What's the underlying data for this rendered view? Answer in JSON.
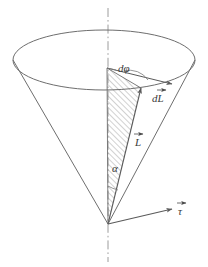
{
  "figure": {
    "background_color": "#ffffff",
    "line_color": "#6e6e6e",
    "label_color": "#3a3a3a",
    "hatch_color": "#9a9a9a",
    "axis_style": "dash-dot"
  },
  "labels": {
    "d_phi": "dφ",
    "dL": "dL",
    "L": "L",
    "alpha": "α",
    "tau": "τ"
  },
  "geometry": {
    "apex": {
      "x": 108,
      "y": 224
    },
    "ellipse": {
      "cx": 104,
      "cy": 60,
      "rx": 91,
      "ry": 30
    },
    "axis_top": {
      "x": 108,
      "y": 8
    },
    "axis_bottom": {
      "x": 108,
      "y": 262
    },
    "hatch_vertex_left": {
      "x": 107,
      "y": 68
    },
    "hatch_vertex_right": {
      "x": 141,
      "y": 88
    },
    "tau_tip": {
      "x": 176,
      "y": 208
    }
  },
  "vectors": [
    {
      "name": "L",
      "symbol": "L",
      "has_arrow": true,
      "from": "apex",
      "to": "rim-point-right"
    },
    {
      "name": "dL",
      "symbol": "dL",
      "has_arrow": true,
      "description": "increment along rim"
    },
    {
      "name": "tau",
      "symbol": "τ",
      "has_arrow": true,
      "description": "torque at apex"
    }
  ],
  "angles": [
    {
      "name": "alpha",
      "symbol": "α",
      "description": "half-angle of cone at apex"
    },
    {
      "name": "d_phi",
      "symbol": "dφ",
      "description": "infinitesimal azimuthal angle at top"
    }
  ]
}
